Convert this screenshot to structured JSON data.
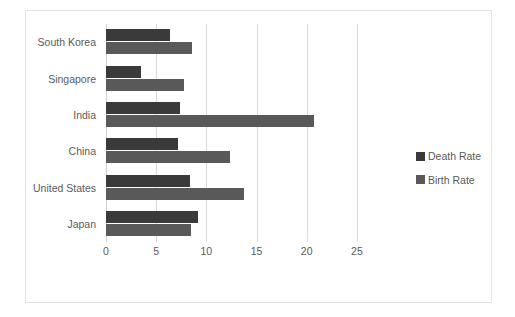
{
  "chart_data": {
    "type": "bar",
    "orientation": "horizontal",
    "title": "",
    "subtitle": "",
    "xlabel": "",
    "ylabel": "",
    "categories": [
      "South Korea",
      "Singapore",
      "India",
      "China",
      "United States",
      "Japan"
    ],
    "series": [
      {
        "name": "Death Rate",
        "color": "#3a3a3a",
        "values": [
          6.4,
          3.5,
          7.4,
          7.2,
          8.4,
          9.2
        ]
      },
      {
        "name": "Birth Rate",
        "color": "#595959",
        "values": [
          8.6,
          7.8,
          20.7,
          12.4,
          13.8,
          8.5
        ]
      }
    ],
    "xlim": [
      0,
      27.9
    ],
    "xticks": [
      0,
      5,
      10,
      15,
      20,
      25
    ],
    "xtick_labels": [
      "0",
      "5",
      "10",
      "15",
      "20",
      "25"
    ],
    "grid": "vertical",
    "legend_position": "right"
  },
  "legend": {
    "entries": [
      {
        "label": "Death Rate",
        "color": "#3a3a3a"
      },
      {
        "label": "Birth Rate",
        "color": "#595959"
      }
    ]
  },
  "style": {
    "border_color": "#e3e3e3",
    "gridline_color": "#d9d9d9",
    "text_color": "#5a5a5a",
    "background": "#ffffff"
  }
}
